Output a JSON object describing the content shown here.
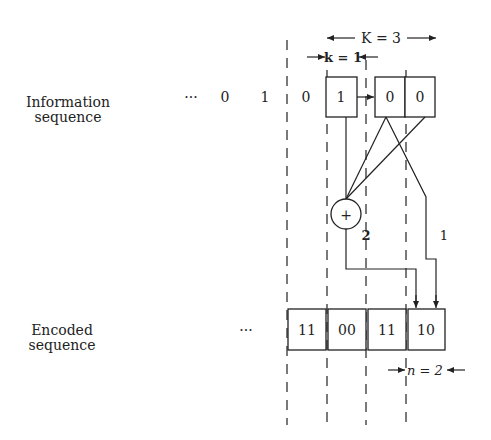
{
  "labels": {
    "information_line1": "Information",
    "information_line2": "sequence",
    "encoded_line1": "Encoded",
    "encoded_line2": "sequence"
  },
  "info_sequence": {
    "ellipsis": "···",
    "bits": [
      "0",
      "1",
      "0"
    ],
    "register": [
      "1",
      "0",
      "0"
    ]
  },
  "encoded_sequence": {
    "ellipsis": "···",
    "outputs": [
      "11",
      "00",
      "11",
      "10"
    ]
  },
  "parameters": {
    "K_label": "K = 3",
    "k_label": "k = 1",
    "n_label": "n = 2"
  },
  "adder": {
    "symbol": "+",
    "output_label": "2"
  },
  "direct_output_label": "1"
}
